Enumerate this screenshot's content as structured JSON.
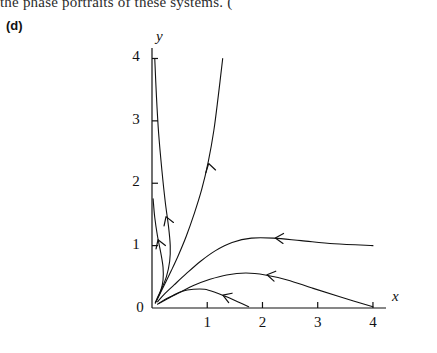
{
  "page": {
    "top_text": "the phase portraits of these systems. (",
    "panel_label": "(d)"
  },
  "chart_data": {
    "type": "line",
    "title": "",
    "subtitle": "",
    "xlabel": "x",
    "ylabel": "y",
    "xlim": [
      0,
      4.2
    ],
    "ylim": [
      0,
      4.2
    ],
    "xticks": [
      0,
      1,
      2,
      3,
      4
    ],
    "xticklabels": [
      "0",
      "1",
      "2",
      "3",
      "4"
    ],
    "yticks": [
      0,
      1,
      2,
      3,
      4
    ],
    "yticklabels": [
      "0",
      "1",
      "2",
      "3",
      "4"
    ],
    "grid": false,
    "legend": null,
    "annotations": [
      {
        "name": "fixed-point-origin",
        "x": 0.08,
        "y": 0.1,
        "note": "stable node at origin"
      }
    ],
    "series": [
      {
        "name": "trajectory-1-steep-left",
        "comment": "from (0.05,4.0) curving down into origin",
        "points": [
          [
            0.05,
            4.0
          ],
          [
            0.08,
            3.4
          ],
          [
            0.12,
            2.8
          ],
          [
            0.18,
            2.2
          ],
          [
            0.24,
            1.7
          ],
          [
            0.3,
            1.3
          ],
          [
            0.33,
            1.0
          ],
          [
            0.32,
            0.75
          ],
          [
            0.26,
            0.5
          ],
          [
            0.17,
            0.3
          ],
          [
            0.09,
            0.15
          ],
          [
            0.06,
            0.08
          ]
        ],
        "arrows": [
          {
            "x": 0.26,
            "y": 1.45,
            "angle": 250
          }
        ]
      },
      {
        "name": "trajectory-2-left-low",
        "comment": "from (0.02,1.75) into origin",
        "points": [
          [
            0.02,
            1.75
          ],
          [
            0.05,
            1.45
          ],
          [
            0.1,
            1.15
          ],
          [
            0.16,
            0.88
          ],
          [
            0.2,
            0.65
          ],
          [
            0.2,
            0.45
          ],
          [
            0.16,
            0.28
          ],
          [
            0.1,
            0.15
          ],
          [
            0.06,
            0.08
          ]
        ],
        "arrows": [
          {
            "x": 0.115,
            "y": 1.08,
            "angle": 250
          }
        ]
      },
      {
        "name": "trajectory-3-tall-right",
        "comment": "from (1.28,4.0) down into origin",
        "points": [
          [
            1.28,
            4.0
          ],
          [
            1.2,
            3.4
          ],
          [
            1.12,
            2.85
          ],
          [
            1.02,
            2.35
          ],
          [
            0.9,
            1.9
          ],
          [
            0.76,
            1.5
          ],
          [
            0.62,
            1.15
          ],
          [
            0.48,
            0.85
          ],
          [
            0.35,
            0.6
          ],
          [
            0.24,
            0.4
          ],
          [
            0.14,
            0.22
          ],
          [
            0.07,
            0.1
          ]
        ],
        "arrows": [
          {
            "x": 1.03,
            "y": 2.3,
            "angle": 255
          }
        ]
      },
      {
        "name": "trajectory-4-right-upper",
        "comment": "from (4.0,1.0) flowing left into origin",
        "points": [
          [
            4.0,
            1.0
          ],
          [
            3.3,
            1.03
          ],
          [
            2.7,
            1.08
          ],
          [
            2.2,
            1.12
          ],
          [
            1.8,
            1.12
          ],
          [
            1.45,
            1.05
          ],
          [
            1.15,
            0.92
          ],
          [
            0.88,
            0.75
          ],
          [
            0.62,
            0.55
          ],
          [
            0.4,
            0.37
          ],
          [
            0.22,
            0.22
          ],
          [
            0.1,
            0.1
          ]
        ],
        "arrows": [
          {
            "x": 2.25,
            "y": 1.12,
            "angle": 183
          }
        ]
      },
      {
        "name": "trajectory-5-right-mid",
        "comment": "from (4.0,0.02) rising slightly then into origin",
        "points": [
          [
            4.0,
            0.02
          ],
          [
            3.4,
            0.18
          ],
          [
            2.9,
            0.32
          ],
          [
            2.45,
            0.45
          ],
          [
            2.05,
            0.53
          ],
          [
            1.7,
            0.56
          ],
          [
            1.35,
            0.53
          ],
          [
            1.05,
            0.46
          ],
          [
            0.75,
            0.36
          ],
          [
            0.5,
            0.25
          ],
          [
            0.28,
            0.15
          ],
          [
            0.12,
            0.07
          ]
        ],
        "arrows": [
          {
            "x": 2.1,
            "y": 0.53,
            "angle": 190
          }
        ]
      },
      {
        "name": "trajectory-6-lower-right",
        "comment": "from (1.75,0.02) into origin",
        "points": [
          [
            1.75,
            0.02
          ],
          [
            1.55,
            0.1
          ],
          [
            1.35,
            0.18
          ],
          [
            1.15,
            0.25
          ],
          [
            0.95,
            0.3
          ],
          [
            0.75,
            0.3
          ],
          [
            0.55,
            0.27
          ],
          [
            0.38,
            0.2
          ],
          [
            0.22,
            0.13
          ],
          [
            0.1,
            0.06
          ]
        ],
        "arrows": [
          {
            "x": 1.3,
            "y": 0.2,
            "angle": 200
          }
        ]
      }
    ]
  }
}
